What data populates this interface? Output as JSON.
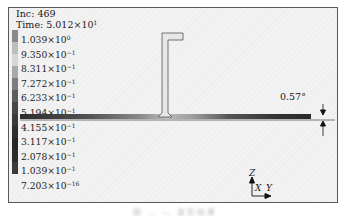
{
  "info": {
    "increment_label": "Inc: 469",
    "time_label": "Time: 5.012×10",
    "time_exponent": "1"
  },
  "legend": {
    "entries": [
      {
        "mantissa": "1.039×10",
        "exp": "0",
        "color": "#8a8a8a"
      },
      {
        "mantissa": "9.350×10",
        "exp": "−1",
        "color": "#d6d6d6"
      },
      {
        "mantissa": "8.311×10",
        "exp": "−1",
        "color": "#a9a9a9"
      },
      {
        "mantissa": "7.272×10",
        "exp": "−1",
        "color": "#7d7d7d"
      },
      {
        "mantissa": "6.233×10",
        "exp": "−1",
        "color": "#5e5e5e"
      },
      {
        "mantissa": "5.194×10",
        "exp": "−1",
        "color": "#474747"
      },
      {
        "mantissa": "4.155×10",
        "exp": "−1",
        "color": "#3a3a3a"
      },
      {
        "mantissa": "3.117×10",
        "exp": "−1",
        "color": "#2e2e2e"
      },
      {
        "mantissa": "2.078×10",
        "exp": "−1",
        "color": "#262626"
      },
      {
        "mantissa": "1.039×10",
        "exp": "−1",
        "color": "#2c2c2c"
      },
      {
        "mantissa": "7.203×10",
        "exp": "−16",
        "color": "#3a3a3a"
      }
    ],
    "bar_colors": [
      "#8a8a8a",
      "#bdbdbd",
      "#d6d6d6",
      "#a9a9a9",
      "#7d7d7d",
      "#5e5e5e",
      "#474747",
      "#3a3a3a",
      "#2e2e2e",
      "#262626",
      "#2c2c2c",
      "#3a3a3a"
    ]
  },
  "annotation": {
    "angle_label": "0.57°"
  },
  "triad": {
    "z_label": "Z",
    "x_label": "X",
    "y_label": "Y"
  },
  "caption": {
    "text": "图 — — 变形结果"
  }
}
